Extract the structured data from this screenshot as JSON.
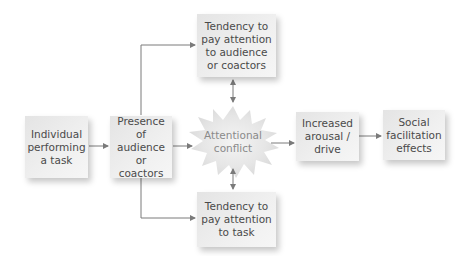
{
  "diagram": {
    "type": "flowchart",
    "nodes": {
      "individual": {
        "label": "Individual\nperforming\na task"
      },
      "presence": {
        "label": "Presence of\naudience or\ncoactors"
      },
      "attend_audience": {
        "label": "Tendency to\npay attention\nto audience\nor coactors"
      },
      "conflict": {
        "label": "Attentional\nconflict"
      },
      "attend_task": {
        "label": "Tendency to\npay attention\nto task"
      },
      "arousal": {
        "label": "Increased\narousal /\ndrive"
      },
      "effects": {
        "label": "Social\nfacilitation\neffects"
      }
    },
    "edges": [
      {
        "from": "individual",
        "to": "presence"
      },
      {
        "from": "presence",
        "to": "attend_audience"
      },
      {
        "from": "presence",
        "to": "conflict"
      },
      {
        "from": "presence",
        "to": "attend_task"
      },
      {
        "from": "attend_audience",
        "to": "conflict",
        "bidirectional": true
      },
      {
        "from": "attend_task",
        "to": "conflict",
        "bidirectional": true
      },
      {
        "from": "conflict",
        "to": "arousal"
      },
      {
        "from": "arousal",
        "to": "effects"
      }
    ],
    "colors": {
      "box_fill": "#ececec",
      "text": "#4a4a4a",
      "burst_text": "#8a8a8a",
      "line": "#7a7a7a"
    }
  }
}
